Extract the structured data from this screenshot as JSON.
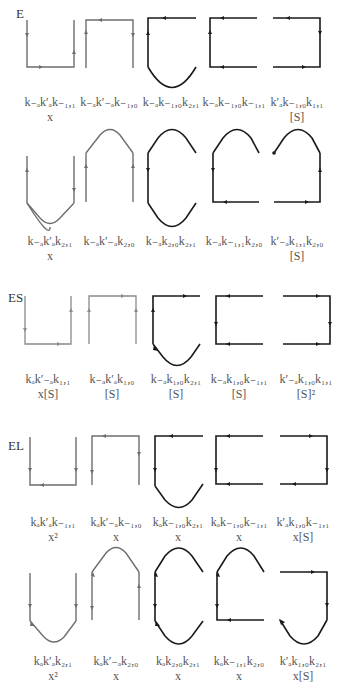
{
  "sections": [
    {
      "id": "E",
      "label": "E",
      "top": 6
    },
    {
      "id": "ES",
      "label": "ES",
      "top": 290
    },
    {
      "id": "EL",
      "label": "EL",
      "top": 438
    }
  ],
  "rows": [
    {
      "section": "E",
      "row": 1,
      "terms": [
        {
          "term": "k₋ₐk′ₐk₋₁,₁",
          "factor": "x"
        },
        {
          "term": "k₋ₐk′₋ₐk₋₁,₀",
          "factor": ""
        },
        {
          "term": "k₋ₐk₋₁,₀k₂,₁",
          "factor": ""
        },
        {
          "term": "k₋ₐk₋₁,₀k₋₁,₁",
          "factor": ""
        },
        {
          "term": "k′ₐk₋₁,₀k₁,₁",
          "factor": "[S]"
        }
      ]
    },
    {
      "section": "E",
      "row": 2,
      "terms": [
        {
          "term": "k₋ₐk′ₐk₂,₁",
          "factor": "x"
        },
        {
          "term": "k₋ₐk′₋ₐk₂,₀",
          "factor": ""
        },
        {
          "term": "k₋ₐk₂,₀k₂,₁",
          "factor": ""
        },
        {
          "term": "k₋ₐk₋₁,₁k₂,₀",
          "factor": ""
        },
        {
          "term": "k′₋ₐk₁,₁k₂,₀",
          "factor": "[S]"
        }
      ]
    },
    {
      "section": "ES",
      "row": 1,
      "terms": [
        {
          "term": "kₐk′₋ₐk₁,₁",
          "factor": "x[S]"
        },
        {
          "term": "k₋ₐk′ₐk₁,₀",
          "factor": "[S]"
        },
        {
          "term": "k₋ₐk₁,₀k₂,₁",
          "factor": "[S]"
        },
        {
          "term": "k₋ₐk₁,₀k₋₁,₁",
          "factor": "[S]"
        },
        {
          "term": "k′₋ₐk₁,₀k₁,₁",
          "factor": "[S]²"
        }
      ]
    },
    {
      "section": "EL",
      "row": 1,
      "terms": [
        {
          "term": "kₐk′ₐk₋₁,₁",
          "factor": "x²"
        },
        {
          "term": "kₐk′₋ₐk₋₁,₀",
          "factor": "x"
        },
        {
          "term": "kₐk₋₁,₀k₂,₁",
          "factor": "x"
        },
        {
          "term": "kₐk₋₁,₀k₋₁,₁",
          "factor": "x"
        },
        {
          "term": "k′ₐk₁,₀k₋₁,₁",
          "factor": "x[S]"
        }
      ]
    },
    {
      "section": "EL",
      "row": 2,
      "terms": [
        {
          "term": "kₐk′ₐk₂,₁",
          "factor": "x²"
        },
        {
          "term": "kₐk′₋ₐk₂,₀",
          "factor": "x"
        },
        {
          "term": "kₐk₂,₀k₂,₁",
          "factor": "x"
        },
        {
          "term": "kₐk₋₁,₁k₂,₀",
          "factor": "x"
        },
        {
          "term": "k′ₐk₁,₀k₂,₁",
          "factor": "x[S]"
        }
      ]
    }
  ],
  "colors": {
    "gray_line": "#6e6e6e",
    "dark_line": "#1a1a1a",
    "text": "#555555"
  }
}
